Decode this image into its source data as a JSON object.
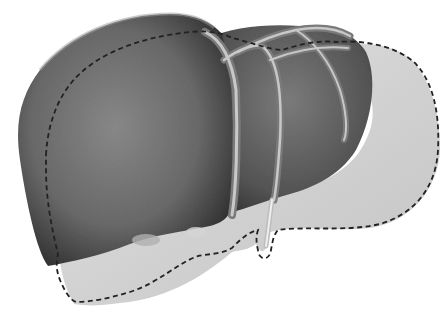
{
  "image": {
    "subject": "liver illustration",
    "style": "grayscale airbrushed medical illustration",
    "width": 442,
    "height": 311
  },
  "colors": {
    "background": "#ffffff",
    "organ_dark": "#3a3a3a",
    "organ_mid": "#7a7a7a",
    "organ_light": "#a8a8a8",
    "overlay_fill": "#d9d9d9",
    "overlay_highlight": "#eeeeee",
    "vessel": "#9a9a9a",
    "vessel_highlight": "#d0d0d0",
    "dash_outline": "#222222"
  },
  "elements": {
    "organ": "liver body (right and left lobes)",
    "vessels": "hepatic veins",
    "overlay": "dashed outline of graft / resection region"
  }
}
